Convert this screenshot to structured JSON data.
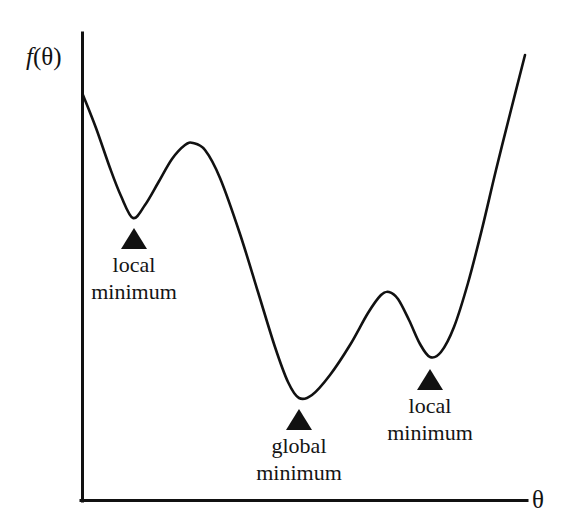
{
  "figure": {
    "background_color": "#ffffff",
    "ink_color": "#111111",
    "axes": {
      "y_label": "f(θ)",
      "y_label_italic_part": "f",
      "y_label_rest": "(θ)",
      "x_label": "θ",
      "origin": {
        "x": 82,
        "y": 501
      },
      "y_axis_top": {
        "x": 82,
        "y": 33
      },
      "x_axis_right": {
        "x": 527,
        "y": 501
      },
      "line_width": 3,
      "ticks": [],
      "grid": false
    },
    "annotations": [
      {
        "id": "local-minimum-left",
        "line1": "local",
        "line2": "minimum",
        "marker": "triangle-up",
        "marker_x": 134,
        "marker_top": 228,
        "marker_width": 26,
        "marker_height": 21,
        "text_x": 134,
        "text_top": 252
      },
      {
        "id": "global-minimum",
        "line1": "global",
        "line2": "minimum",
        "marker": "triangle-up",
        "marker_x": 299,
        "marker_top": 409,
        "marker_width": 26,
        "marker_height": 21,
        "text_x": 299,
        "text_top": 433
      },
      {
        "id": "local-minimum-right",
        "line1": "local",
        "line2": "minimum",
        "marker": "triangle-up",
        "marker_x": 430,
        "marker_top": 369,
        "marker_width": 26,
        "marker_height": 21,
        "text_x": 430,
        "text_top": 393
      }
    ]
  },
  "chart_data": {
    "type": "line",
    "title": "",
    "subtitle": "",
    "xlabel": "θ",
    "ylabel": "f(θ)",
    "xlim": [
      82,
      527
    ],
    "ylim": [
      501,
      33
    ],
    "grid": false,
    "legend": null,
    "axis_ticks_shown": false,
    "stroke_color": "#111111",
    "stroke_width": 2.6,
    "series": [
      {
        "name": "f(θ)",
        "description": "Non-convex objective curve with two local minima and one global minimum",
        "points": [
          {
            "x": 83,
            "y": 95
          },
          {
            "x": 96,
            "y": 128
          },
          {
            "x": 110,
            "y": 168
          },
          {
            "x": 121,
            "y": 196
          },
          {
            "x": 133,
            "y": 218
          },
          {
            "x": 145,
            "y": 205
          },
          {
            "x": 158,
            "y": 183
          },
          {
            "x": 172,
            "y": 159
          },
          {
            "x": 185,
            "y": 145
          },
          {
            "x": 193,
            "y": 143
          },
          {
            "x": 205,
            "y": 150
          },
          {
            "x": 220,
            "y": 178
          },
          {
            "x": 240,
            "y": 234
          },
          {
            "x": 258,
            "y": 292
          },
          {
            "x": 275,
            "y": 347
          },
          {
            "x": 288,
            "y": 382
          },
          {
            "x": 299,
            "y": 398
          },
          {
            "x": 312,
            "y": 395
          },
          {
            "x": 330,
            "y": 375
          },
          {
            "x": 350,
            "y": 345
          },
          {
            "x": 368,
            "y": 313
          },
          {
            "x": 381,
            "y": 295
          },
          {
            "x": 389,
            "y": 292
          },
          {
            "x": 398,
            "y": 299
          },
          {
            "x": 409,
            "y": 320
          },
          {
            "x": 420,
            "y": 344
          },
          {
            "x": 430,
            "y": 357
          },
          {
            "x": 441,
            "y": 352
          },
          {
            "x": 454,
            "y": 327
          },
          {
            "x": 468,
            "y": 283
          },
          {
            "x": 482,
            "y": 229
          },
          {
            "x": 496,
            "y": 170
          },
          {
            "x": 511,
            "y": 110
          },
          {
            "x": 525,
            "y": 55
          }
        ]
      }
    ],
    "critical_points": [
      {
        "kind": "start",
        "x": 83,
        "y": 95,
        "label": ""
      },
      {
        "kind": "local-minimum",
        "x": 133,
        "y": 218,
        "label": "local minimum"
      },
      {
        "kind": "local-maximum",
        "x": 193,
        "y": 143,
        "label": ""
      },
      {
        "kind": "global-minimum",
        "x": 299,
        "y": 398,
        "label": "global minimum"
      },
      {
        "kind": "local-maximum",
        "x": 389,
        "y": 292,
        "label": ""
      },
      {
        "kind": "local-minimum",
        "x": 430,
        "y": 357,
        "label": "local minimum"
      },
      {
        "kind": "end",
        "x": 525,
        "y": 55,
        "label": ""
      }
    ]
  }
}
